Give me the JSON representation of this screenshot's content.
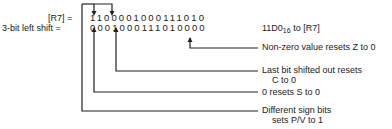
{
  "rows": {
    "register_label": "[R7] =",
    "register_bits": "1100001000111010",
    "shift_label": "3-bit left shift =",
    "shift_bits": "0001000111010000"
  },
  "result": {
    "value": "11D0",
    "base": "16",
    "suffix": " to [R7]"
  },
  "annotations": [
    {
      "line1": "Non-zero value resets Z to 0",
      "line2": ""
    },
    {
      "line1": "Last bit shifted out resets",
      "line2": "C to 0"
    },
    {
      "line1": "0 resets S to 0",
      "line2": ""
    },
    {
      "line1": "Different sign bits",
      "line2": "sets P/V to 1"
    }
  ],
  "colors": {
    "ink": "#222222",
    "background": "#ffffff"
  }
}
